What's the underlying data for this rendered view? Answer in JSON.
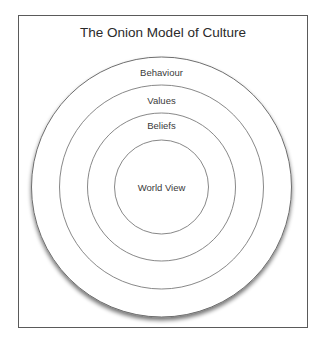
{
  "title": "The Onion Model of Culture",
  "layers": [
    {
      "label": "Behaviour",
      "radius": 130
    },
    {
      "label": "Values",
      "radius": 102
    },
    {
      "label": "Beliefs",
      "radius": 74
    },
    {
      "label": "World View",
      "radius": 47
    }
  ],
  "colors": {
    "frame": "#5a5a5a",
    "stroke": "#6e6e6e",
    "text": "#3a3a3a"
  }
}
